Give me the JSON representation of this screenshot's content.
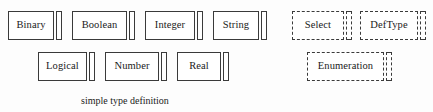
{
  "diagram": {
    "type": "uml-class-boxes",
    "background_color": "#fdfdfd",
    "stroke_color": "#3a3a3a",
    "groups": [
      {
        "id": "simple-type-definition",
        "caption": "simple type definition",
        "border_style": "solid",
        "rows": [
          {
            "nodes": [
              {
                "label": "Binary",
                "x": 8,
                "y": 11,
                "width": 54
              },
              {
                "label": "Boolean",
                "x": 72,
                "y": 11,
                "width": 63
              },
              {
                "label": "Integer",
                "x": 145,
                "y": 11,
                "width": 58
              },
              {
                "label": "String",
                "x": 213,
                "y": 11,
                "width": 54
              }
            ]
          },
          {
            "nodes": [
              {
                "label": "Logical",
                "x": 38,
                "y": 52,
                "width": 57
              },
              {
                "label": "Number",
                "x": 105,
                "y": 52,
                "width": 62
              },
              {
                "label": "Real",
                "x": 177,
                "y": 52,
                "width": 52
              }
            ]
          }
        ]
      },
      {
        "id": "type-definition",
        "caption": "type definition",
        "border_style": "dashed",
        "rows": [
          {
            "nodes": [
              {
                "label": "Select",
                "x": 17,
                "y": 11,
                "width": 60
              },
              {
                "label": "DefType",
                "x": 85,
                "y": 11,
                "width": 66
              }
            ]
          },
          {
            "nodes": [
              {
                "label": "Enumeration",
                "x": 32,
                "y": 52,
                "width": 85
              }
            ]
          }
        ]
      }
    ]
  }
}
